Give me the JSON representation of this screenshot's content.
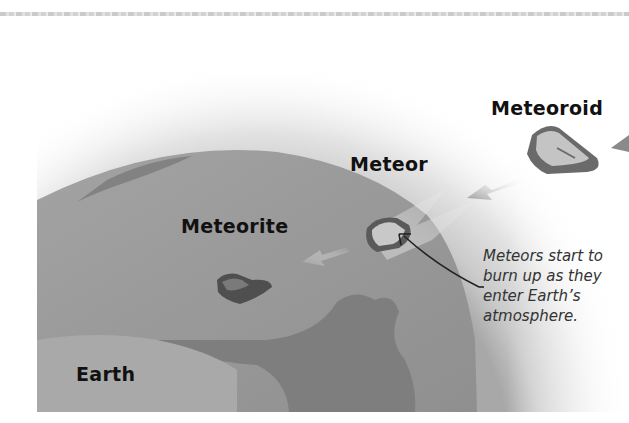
{
  "figure": {
    "labels": {
      "meteoroid": "Meteoroid",
      "meteor": "Meteor",
      "meteorite": "Meteorite",
      "earth": "Earth"
    },
    "caption_lines": [
      "Meteors start to",
      "burn up as they",
      "enter Earth’s",
      "atmosphere."
    ],
    "colors": {
      "ocean": "#9a9a9a",
      "land": "#7d7d7d",
      "atmosphere": "#cfcfcf",
      "rock": "#5e5e5e",
      "rock_highlight": "#c4c4c4",
      "text": "#111111",
      "caption_text": "#333333"
    }
  }
}
